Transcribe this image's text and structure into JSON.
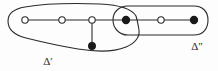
{
  "figure": {
    "background_color": "#fdfdfd",
    "stroke_color": "#2b2b2b",
    "node_fill_color": "#1a1a1a",
    "node_open_color": "#ffffff",
    "width": 218,
    "height": 71
  },
  "graph": {
    "nodes": [
      {
        "id": "n1",
        "type": "open",
        "x": 25,
        "y": 20,
        "label": ""
      },
      {
        "id": "n2",
        "type": "open",
        "x": 62,
        "y": 20,
        "label": ""
      },
      {
        "id": "n3",
        "type": "open",
        "x": 92,
        "y": 20,
        "label": ""
      },
      {
        "id": "n4",
        "type": "filled",
        "x": 92,
        "y": 46,
        "label": ""
      },
      {
        "id": "n5",
        "type": "filled",
        "x": 126,
        "y": 20,
        "label": ""
      },
      {
        "id": "n6",
        "type": "open",
        "x": 161,
        "y": 20,
        "label": ""
      },
      {
        "id": "n7",
        "type": "filled",
        "x": 194,
        "y": 20,
        "label": ""
      }
    ],
    "edges": [
      {
        "from": "n1",
        "to": "n2"
      },
      {
        "from": "n2",
        "to": "n3"
      },
      {
        "from": "n3",
        "to": "n4"
      },
      {
        "from": "n3",
        "to": "n5"
      },
      {
        "from": "n5",
        "to": "n6"
      },
      {
        "from": "n6",
        "to": "n7"
      }
    ]
  },
  "regions": [
    {
      "id": "delta-prime",
      "label": "Δ′",
      "label_x": 48,
      "label_y": 65,
      "path": "M 136 16 C 132 9 120 5 100 4 C 72 3 42 4 25 7 C 13 9 8 14 8 21 C 8 29 14 35 26 38 C 42 42 60 46 78 49 C 96 52 114 52 126 47 C 136 43 140 36 139 30 C 138 24 137 19 136 16 Z"
    },
    {
      "id": "delta-double-prime",
      "label": "Δ″",
      "label_x": 197,
      "label_y": 50,
      "path": "M 128 6 C 119 6 113 12 113 20 C 113 28 119 35 128 35 C 150 35 178 35 194 35 C 203 35 208 29 208 20 C 208 12 203 6 194 6 C 178 6 150 6 128 6 Z"
    }
  ]
}
